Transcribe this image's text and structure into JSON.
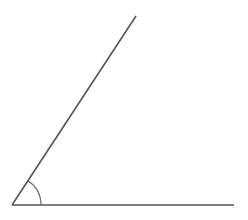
{
  "diagram": {
    "type": "angle",
    "vertex": [
      12,
      205
    ],
    "ray_horizontal_end": [
      234,
      205
    ],
    "ray_slanted_end": [
      136,
      16
    ],
    "arc_radius": 29,
    "stroke_color": "#555555",
    "background": "#ffffff"
  }
}
